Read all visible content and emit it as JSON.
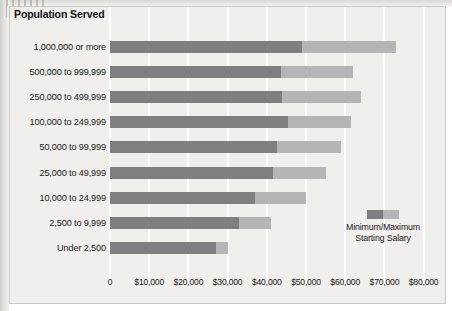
{
  "chart_data": {
    "type": "bar",
    "orientation": "horizontal",
    "stacked_range": true,
    "title": "Population Served",
    "xlabel": "",
    "ylabel": "Population Served",
    "xlim": [
      0,
      80000
    ],
    "grid": true,
    "legend_position": "inside-right",
    "legend_label": "Minimum/Maximum Starting Salary",
    "legend_lines": [
      "Minimum/Maximum",
      "Starting Salary"
    ],
    "categories": [
      "1,000,000 or more",
      "500,000 to 999,999",
      "250,000 to 499,999",
      "100,000 to 249,999",
      "50,000 to 99,999",
      "25,000 to 49,999",
      "10,000 to 24,999",
      "2,500 to 9,999",
      "Under 2,500"
    ],
    "series": [
      {
        "name": "Minimum Starting Salary",
        "color": "#7f7f7f",
        "values": [
          49000,
          43500,
          44000,
          45500,
          42500,
          41500,
          37000,
          33000,
          27000
        ]
      },
      {
        "name": "Maximum Starting Salary",
        "color": "#b5b5b5",
        "values": [
          73000,
          62000,
          64000,
          61500,
          59000,
          55000,
          50000,
          41000,
          30000
        ]
      }
    ],
    "xticks": [
      0,
      10000,
      20000,
      30000,
      40000,
      50000,
      60000,
      70000,
      80000
    ],
    "xtick_labels": [
      "0",
      "$10,000",
      "$20,000",
      "$30,000",
      "$40,000",
      "$50,000",
      "$60,000",
      "$70,000",
      "$80,000"
    ],
    "colors": {
      "panel_background": "#f0efec",
      "gridline": "#ffffff",
      "panel_border": "#c9c8c3",
      "text": "#1a1a1a",
      "min_bar": "#7f7f7f",
      "max_bar": "#b5b5b5"
    }
  }
}
